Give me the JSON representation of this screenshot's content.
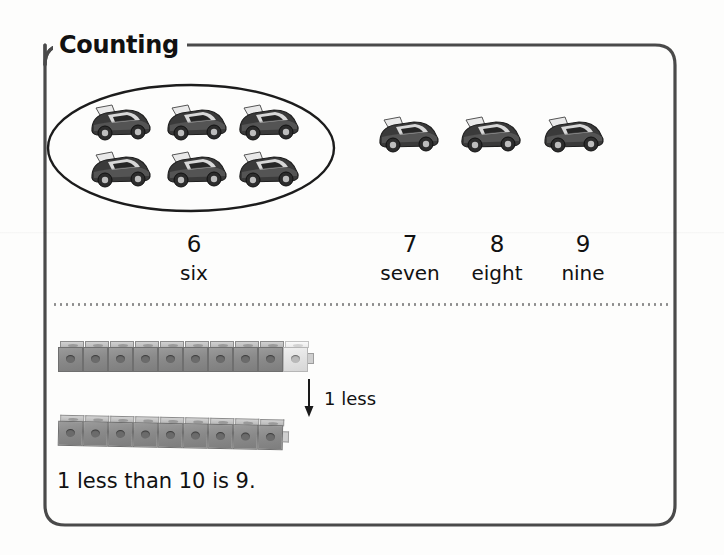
{
  "page": {
    "section_title": "Counting",
    "background_color": "#fdfdfc",
    "frame_color": "#4a4a4a"
  },
  "counting_row": {
    "grouped_set": {
      "name": "toy-car-group-circled",
      "item_icon": "toy-car-icon",
      "count": 6,
      "rows": 2,
      "columns": 3,
      "enclosure": "ellipse"
    },
    "single_sets": [
      {
        "name": "toy-car-single-seven",
        "item_icon": "toy-car-icon",
        "count": 1
      },
      {
        "name": "toy-car-single-eight",
        "item_icon": "toy-car-icon",
        "count": 1
      },
      {
        "name": "toy-car-single-nine",
        "item_icon": "toy-car-icon",
        "count": 1
      }
    ],
    "labels": [
      {
        "numeral": "6",
        "word": "six"
      },
      {
        "numeral": "7",
        "word": "seven"
      },
      {
        "numeral": "8",
        "word": "eight"
      },
      {
        "numeral": "9",
        "word": "nine"
      }
    ]
  },
  "one_less_section": {
    "arrow_icon": "arrow-down-icon",
    "arrow_label": "1 less",
    "top_train": {
      "name": "cube-train-ten",
      "total_cubes": 10,
      "gray_cubes": 9,
      "light_cubes": 1,
      "cube_color": "#8a8a8a",
      "light_cube_color": "#e4e4e4"
    },
    "bottom_train": {
      "name": "cube-train-nine",
      "total_cubes": 9,
      "gray_cubes": 9,
      "light_cubes": 0,
      "cube_color": "#8a8a8a"
    },
    "sentence": "1 less than 10 is 9."
  }
}
